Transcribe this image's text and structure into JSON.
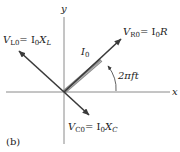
{
  "figure": {
    "panel_label": "(b)",
    "axes": {
      "x_label": "x",
      "y_label": "y",
      "origin": [
        64,
        92
      ],
      "x_range_px": [
        6,
        170
      ],
      "y_range_px": [
        17,
        144
      ]
    },
    "phasors": [
      {
        "name": "V_R0",
        "label_main": "V",
        "label_sub": "R0",
        "label_eq": "= I",
        "label_eq_sub": "0",
        "label_tail": "R",
        "tip": [
          122,
          38
        ],
        "direction": "along current (angle 2πft)"
      },
      {
        "name": "V_L0",
        "label_main": "V",
        "label_sub": "L0",
        "label_eq": "= I",
        "label_eq_sub": "0",
        "label_tail": "X",
        "label_tail_sub": "L",
        "tip": [
          18,
          50
        ],
        "direction": "leads current by 90°"
      },
      {
        "name": "V_C0",
        "label_main": "V",
        "label_sub": "C0",
        "label_eq": "= I",
        "label_eq_sub": "0",
        "label_tail": "X",
        "label_tail_sub": "C",
        "tip": [
          90,
          116
        ],
        "direction": "lags current by 90°"
      }
    ],
    "current": {
      "label_main": "I",
      "label_sub": "0",
      "tip": [
        100,
        58
      ]
    },
    "angle": {
      "label": "2πft"
    },
    "colors": {
      "axis": "#8a8a8a",
      "arrow": "#3a3a3a",
      "current_band": "#8c8c8c",
      "text": "#222222"
    }
  }
}
